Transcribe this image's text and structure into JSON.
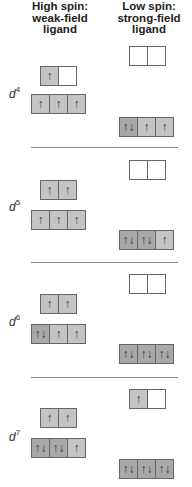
{
  "headers": {
    "high_spin": [
      "High spin:",
      "weak-field",
      "ligand"
    ],
    "low_spin": [
      "Low spin:",
      "strong-field",
      "ligand"
    ]
  },
  "colors": {
    "empty": "#ffffff",
    "single_electron": "#c4c4c4",
    "paired_electrons": "#a8a8a8",
    "border": "#666666",
    "divider": "#888888"
  },
  "configs": [
    {
      "label": "d",
      "sup": "4",
      "high_spin": {
        "eg": [
          "↑",
          ""
        ],
        "t2g": [
          "↑",
          "↑",
          "↑"
        ]
      },
      "low_spin": {
        "eg": [
          "",
          ""
        ],
        "t2g": [
          "↑↓",
          "↑",
          "↑"
        ]
      }
    },
    {
      "label": "d",
      "sup": "5",
      "high_spin": {
        "eg": [
          "↑",
          "↑"
        ],
        "t2g": [
          "↑",
          "↑",
          "↑"
        ]
      },
      "low_spin": {
        "eg": [
          "",
          ""
        ],
        "t2g": [
          "↑↓",
          "↑↓",
          "↑"
        ]
      }
    },
    {
      "label": "d",
      "sup": "6",
      "high_spin": {
        "eg": [
          "↑",
          "↑"
        ],
        "t2g": [
          "↑↓",
          "↑",
          "↑"
        ]
      },
      "low_spin": {
        "eg": [
          "",
          ""
        ],
        "t2g": [
          "↑↓",
          "↑↓",
          "↑↓"
        ]
      }
    },
    {
      "label": "d",
      "sup": "7",
      "high_spin": {
        "eg": [
          "↑",
          "↑"
        ],
        "t2g": [
          "↑↓",
          "↑↓",
          "↑"
        ]
      },
      "low_spin": {
        "eg": [
          "↑",
          ""
        ],
        "t2g": [
          "↑↓",
          "↑↓",
          "↑↓"
        ]
      }
    }
  ]
}
